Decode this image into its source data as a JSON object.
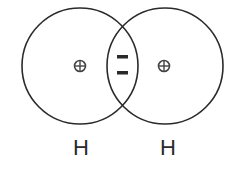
{
  "diagram": {
    "atoms": [
      {
        "label": "H",
        "nucleus_symbol": "⊕",
        "cx": 80,
        "cy": 66,
        "r": 58
      },
      {
        "label": "H",
        "nucleus_symbol": "⊕",
        "cx": 165,
        "cy": 66,
        "r": 58
      }
    ],
    "shared_electrons": [
      "−",
      "−"
    ],
    "stroke_color": "#2a2a2a",
    "background": "#ffffff"
  }
}
